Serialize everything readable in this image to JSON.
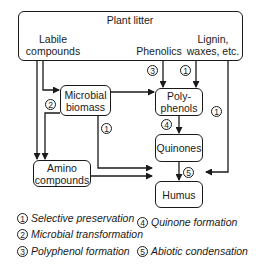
{
  "diagram": {
    "top_box": {
      "title": "Plant litter",
      "sources": [
        {
          "line1": "Labile",
          "line2": "compounds"
        },
        {
          "line1": "Phenolics"
        },
        {
          "line1": "Lignin,",
          "line2": "waxes, etc."
        }
      ]
    },
    "nodes": {
      "microbial_biomass": {
        "line1": "Microbial",
        "line2": "biomass"
      },
      "polyphenols": {
        "line1": "Poly-",
        "line2": "phenols"
      },
      "quinones": {
        "line1": "Quinones"
      },
      "amino_compounds": {
        "line1": "Amino",
        "line2": "compounds"
      },
      "humus": {
        "line1": "Humus"
      }
    },
    "edge_labels": {
      "phenolics_to_polyphenols": "3",
      "lignin_to_polyphenols": "1",
      "labile_to_microbial": "2",
      "microbial_to_humus": "1",
      "lignin_to_humus": "1",
      "polyphenols_to_quinones": "4",
      "quinones_to_humus": "5"
    },
    "legend": [
      {
        "num": "1",
        "text": "Selective preservation"
      },
      {
        "num": "2",
        "text": "Microbial transformation"
      },
      {
        "num": "3",
        "text": "Polyphenol formation"
      },
      {
        "num": "4",
        "text": "Quinone formation"
      },
      {
        "num": "5",
        "text": "Abiotic condensation"
      }
    ],
    "colors": {
      "line": "#1a1a1a",
      "background": "#ffffff"
    }
  }
}
